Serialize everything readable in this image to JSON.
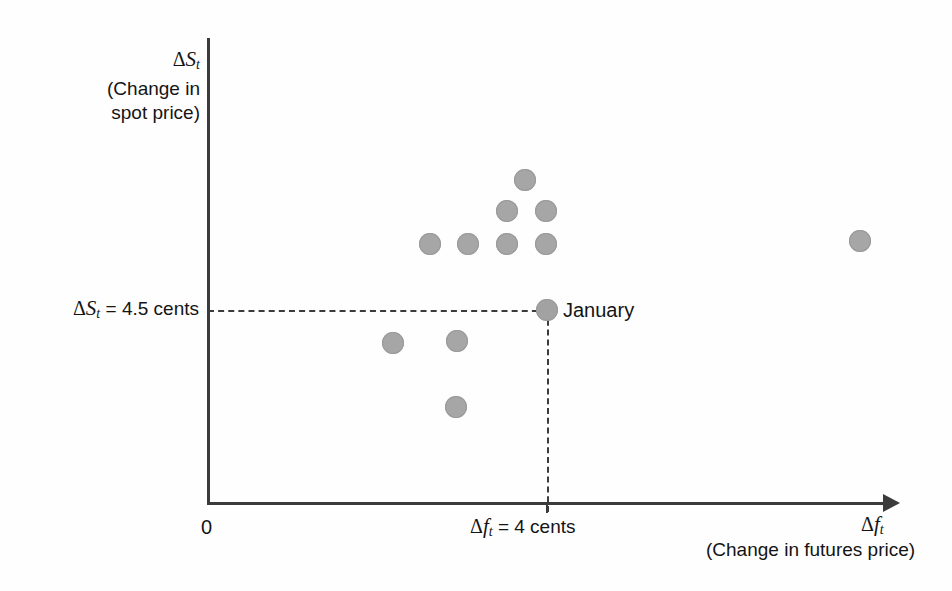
{
  "chart_data": {
    "type": "scatter",
    "title": "",
    "xlabel": "Δfₜ (Change in futures price)",
    "ylabel": "ΔSₜ (Change in spot price)",
    "axis_symbols": {
      "x_symbol_delta": "Δ",
      "x_symbol_var": "f",
      "x_symbol_sub": "t",
      "y_symbol_delta": "Δ",
      "y_symbol_var": "S",
      "y_symbol_sub": "t"
    },
    "y_axis_title_lines": [
      "(Change in",
      "spot price)"
    ],
    "x_axis_title_text": "(Change in futures price)",
    "origin_label": "0",
    "grid": false,
    "legend": false,
    "reference_lines": {
      "horizontal": {
        "label_delta": "Δ",
        "label_var": "S",
        "label_sub": "t",
        "label_rest": "= 4.5 cents",
        "value": 4.5,
        "units": "cents",
        "style": "dashed"
      },
      "vertical": {
        "label_delta": "Δ",
        "label_var": "f",
        "label_sub": "t",
        "label_rest": "= 4 cents",
        "value": 4,
        "units": "cents",
        "style": "dashed"
      }
    },
    "annotations": [
      {
        "text": "January",
        "x": 4,
        "y": 4.5
      }
    ],
    "points": [
      {
        "name": "point-1",
        "px": 430,
        "py": 244
      },
      {
        "name": "point-2",
        "px": 468,
        "py": 244
      },
      {
        "name": "point-3",
        "px": 507,
        "py": 244
      },
      {
        "name": "point-4",
        "px": 546,
        "py": 244
      },
      {
        "name": "point-5",
        "px": 507,
        "py": 211
      },
      {
        "name": "point-6",
        "px": 546,
        "py": 211
      },
      {
        "name": "point-7",
        "px": 525,
        "py": 180
      },
      {
        "name": "point-8",
        "px": 860,
        "py": 241
      },
      {
        "name": "point-january",
        "px": 547,
        "py": 310
      },
      {
        "name": "point-9",
        "px": 393,
        "py": 343
      },
      {
        "name": "point-10",
        "px": 457,
        "py": 341
      },
      {
        "name": "point-11",
        "px": 456,
        "py": 407
      }
    ],
    "colors": {
      "point_fill": "#a6a6a6",
      "axis": "#3b3b3b",
      "text": "#141414",
      "background": "#fefefe"
    }
  },
  "labels": {
    "y_axis_symbol_delta": "Δ",
    "y_axis_symbol_var": "S",
    "y_axis_symbol_sub": "t",
    "y_axis_line2": "(Change in",
    "y_axis_line3": "spot price)",
    "y_tick_delta": "Δ",
    "y_tick_var": "S",
    "y_tick_sub": "t",
    "y_tick_rest": "= 4.5 cents",
    "x_tick_delta": "Δ",
    "x_tick_var": "f",
    "x_tick_sub": "t",
    "x_tick_rest": "= 4 cents",
    "origin": "0",
    "x_axis_symbol_delta": "Δ",
    "x_axis_symbol_var": "f",
    "x_axis_symbol_sub": "t",
    "x_axis_caption": "(Change in futures price)",
    "january": "January"
  }
}
